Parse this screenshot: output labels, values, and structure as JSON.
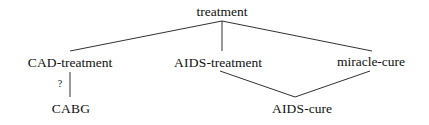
{
  "diagram": {
    "type": "tree",
    "background_color": "#ffffff",
    "line_color": "#1a1a1a",
    "text_color": "#101010",
    "nodes": [
      {
        "id": "treatment",
        "label": "treatment",
        "caps_part": "",
        "rest_part": "treatment",
        "x": 222,
        "y": 12
      },
      {
        "id": "cad-treatment",
        "label": "CAD-treatment",
        "caps_part": "CAD",
        "rest_part": "-treatment",
        "x": 70,
        "y": 62
      },
      {
        "id": "aids-treatment",
        "label": "AIDS-treatment",
        "caps_part": "AIDS",
        "rest_part": "-treatment",
        "x": 218,
        "y": 62
      },
      {
        "id": "miracle-cure",
        "label": "miracle-cure",
        "caps_part": "",
        "rest_part": "miracle-cure",
        "x": 371,
        "y": 62
      },
      {
        "id": "cabg",
        "label": "CABG",
        "caps_part": "CABG",
        "rest_part": "",
        "x": 71,
        "y": 108
      },
      {
        "id": "aids-cure",
        "label": "AIDS-cure",
        "caps_part": "AIDS",
        "rest_part": "-cure",
        "x": 302,
        "y": 108
      }
    ],
    "edges": [
      {
        "id": "treatment-cad",
        "from": "treatment",
        "to": "cad-treatment",
        "x1": 222,
        "y1": 21,
        "x2": 70,
        "y2": 51
      },
      {
        "id": "treatment-aids",
        "from": "treatment",
        "to": "aids-treatment",
        "x1": 222,
        "y1": 21,
        "x2": 222,
        "y2": 51
      },
      {
        "id": "treatment-miracle",
        "from": "treatment",
        "to": "miracle-cure",
        "x1": 222,
        "y1": 21,
        "x2": 372,
        "y2": 51
      },
      {
        "id": "cad-cabg",
        "from": "cad-treatment",
        "to": "cabg",
        "x1": 70,
        "y1": 72,
        "x2": 70,
        "y2": 97
      },
      {
        "id": "aids-treatment-cure",
        "from": "aids-treatment",
        "to": "aids-cure",
        "x1": 220,
        "y1": 71,
        "x2": 295,
        "y2": 97
      },
      {
        "id": "miracle-aids-cure",
        "from": "miracle-cure",
        "to": "aids-cure",
        "x1": 370,
        "y1": 71,
        "x2": 295,
        "y2": 97
      }
    ],
    "edge_labels": [
      {
        "id": "cad-cabg-label",
        "text": "?",
        "x": 60,
        "y": 83
      }
    ]
  }
}
